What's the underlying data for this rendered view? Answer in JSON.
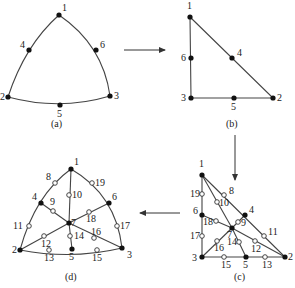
{
  "panels": {
    "a": {
      "caption": "(a)",
      "nodes": [
        {
          "id": "1",
          "x": 59,
          "y": 15
        },
        {
          "id": "2",
          "x": 8,
          "y": 97
        },
        {
          "id": "3",
          "x": 110,
          "y": 96
        },
        {
          "id": "4",
          "x": 29,
          "y": 50
        },
        {
          "id": "5",
          "x": 60,
          "y": 105
        },
        {
          "id": "6",
          "x": 96,
          "y": 50
        }
      ]
    },
    "b": {
      "caption": "(b)",
      "nodes": [
        {
          "id": "1",
          "x": 190,
          "y": 17
        },
        {
          "id": "2",
          "x": 273,
          "y": 98
        },
        {
          "id": "3",
          "x": 191,
          "y": 98
        },
        {
          "id": "4",
          "x": 232,
          "y": 58
        },
        {
          "id": "5",
          "x": 234,
          "y": 98
        },
        {
          "id": "6",
          "x": 191,
          "y": 58
        }
      ]
    },
    "c": {
      "caption": "(c)",
      "corner_nodes": [
        {
          "id": "1",
          "x": 202,
          "y": 175
        },
        {
          "id": "2",
          "x": 285,
          "y": 257
        },
        {
          "id": "3",
          "x": 202,
          "y": 257
        },
        {
          "id": "4",
          "x": 245,
          "y": 215
        },
        {
          "id": "5",
          "x": 246,
          "y": 257
        },
        {
          "id": "6",
          "x": 202,
          "y": 215
        },
        {
          "id": "7",
          "x": 232,
          "y": 228
        }
      ],
      "mid_nodes": [
        {
          "id": "8",
          "x": 224,
          "y": 195
        },
        {
          "id": "9",
          "x": 238,
          "y": 222
        },
        {
          "id": "10",
          "x": 217,
          "y": 202
        },
        {
          "id": "11",
          "x": 264,
          "y": 236
        },
        {
          "id": "12",
          "x": 255,
          "y": 241
        },
        {
          "id": "13",
          "x": 265,
          "y": 257
        },
        {
          "id": "14",
          "x": 239,
          "y": 242
        },
        {
          "id": "15",
          "x": 224,
          "y": 257
        },
        {
          "id": "16",
          "x": 217,
          "y": 241
        },
        {
          "id": "17",
          "x": 202,
          "y": 236
        },
        {
          "id": "18",
          "x": 216,
          "y": 221
        },
        {
          "id": "19",
          "x": 202,
          "y": 194
        }
      ]
    },
    "d": {
      "caption": "(d)",
      "corner_nodes": [
        {
          "id": "1",
          "x": 71,
          "y": 169
        },
        {
          "id": "2",
          "x": 20,
          "y": 250
        },
        {
          "id": "3",
          "x": 122,
          "y": 248
        },
        {
          "id": "4",
          "x": 41,
          "y": 203
        },
        {
          "id": "5",
          "x": 72,
          "y": 249
        },
        {
          "id": "6",
          "x": 109,
          "y": 203
        },
        {
          "id": "7",
          "x": 69,
          "y": 223
        }
      ],
      "mid_nodes": [
        {
          "id": "8",
          "x": 55,
          "y": 183
        },
        {
          "id": "9",
          "x": 53,
          "y": 211
        },
        {
          "id": "10",
          "x": 69,
          "y": 195
        },
        {
          "id": "11",
          "x": 29,
          "y": 226
        },
        {
          "id": "12",
          "x": 44,
          "y": 236
        },
        {
          "id": "13",
          "x": 49,
          "y": 250
        },
        {
          "id": "14",
          "x": 70,
          "y": 236
        },
        {
          "id": "15",
          "x": 97,
          "y": 250
        },
        {
          "id": "16",
          "x": 94,
          "y": 238
        },
        {
          "id": "17",
          "x": 117,
          "y": 226
        },
        {
          "id": "18",
          "x": 89,
          "y": 212
        },
        {
          "id": "19",
          "x": 92,
          "y": 183
        }
      ]
    }
  },
  "arrows": [
    {
      "name": "arrow-a-to-b",
      "from": "a",
      "to": "b"
    },
    {
      "name": "arrow-b-to-c",
      "from": "b",
      "to": "c"
    },
    {
      "name": "arrow-c-to-d",
      "from": "c",
      "to": "d"
    }
  ]
}
